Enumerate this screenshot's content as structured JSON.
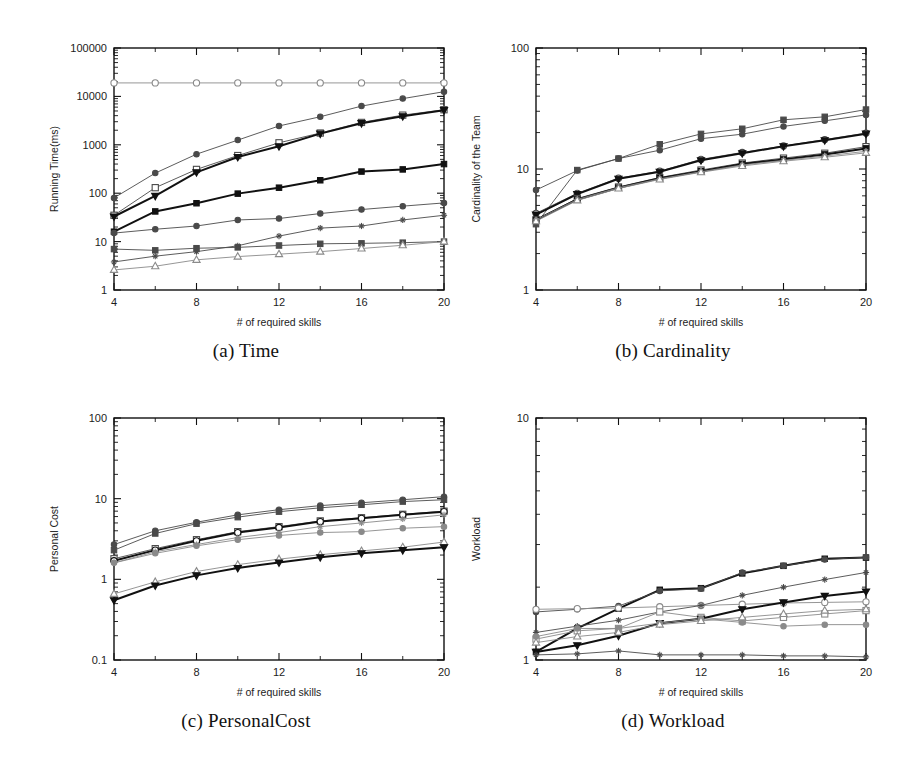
{
  "figure": {
    "panels": [
      {
        "id": "a",
        "caption": "(a) Time",
        "xlabel": "# of required skills",
        "ylabel": "Running Time(ms)"
      },
      {
        "id": "b",
        "caption": "(b) Cardinality",
        "xlabel": "# of required skills",
        "ylabel": "Cardinality of the Team"
      },
      {
        "id": "c",
        "caption": "(c) PersonalCost",
        "xlabel": "# of required skills",
        "ylabel": "Personal Cost"
      },
      {
        "id": "d",
        "caption": "(d) Workload",
        "xlabel": "# of required skills",
        "ylabel": "Workload"
      }
    ]
  },
  "style": {
    "colors": {
      "ink": "#111111",
      "dark": "#1c1c1c",
      "mid": "#4a4a4a",
      "light": "#8a8a8a",
      "paper": "#ffffff"
    },
    "markers": [
      "circle-open",
      "square-open",
      "circle-filled",
      "square-filled",
      "triangle-down-filled",
      "triangle-up-open",
      "cross",
      "diamond-open"
    ]
  },
  "chart_data": [
    {
      "type": "line",
      "panel": "a",
      "title": "(a) Time",
      "xlabel": "# of required skills",
      "ylabel": "Running Time(ms)",
      "xticks": [
        4,
        8,
        12,
        16,
        20
      ],
      "x": [
        4,
        6,
        8,
        10,
        12,
        14,
        16,
        18,
        20
      ],
      "xlim": [
        4,
        20
      ],
      "ylim": [
        1,
        100000
      ],
      "yscale": "log",
      "yticks": [
        1,
        10,
        100,
        1000,
        10000,
        100000
      ],
      "ytick_labels": [
        "1",
        "10",
        "100",
        "1000",
        "10000",
        "100000"
      ],
      "grid": false,
      "legend": "none",
      "series": [
        {
          "name": "S1",
          "marker": "circle-open",
          "weight": "thin",
          "shade": "light",
          "values": [
            19000,
            19000,
            19000,
            19000,
            19000,
            19000,
            19000,
            19000,
            19000
          ]
        },
        {
          "name": "S2",
          "marker": "circle-filled",
          "weight": "thin",
          "shade": "mid",
          "values": [
            80,
            260,
            640,
            1250,
            2450,
            3800,
            6300,
            9000,
            12500
          ]
        },
        {
          "name": "S3",
          "marker": "square-open",
          "weight": "thin",
          "shade": "mid",
          "values": [
            35,
            130,
            310,
            600,
            1100,
            1750,
            2900,
            4100,
            5300
          ]
        },
        {
          "name": "S4",
          "marker": "triangle-down-filled",
          "weight": "thick",
          "shade": "ink",
          "values": [
            33,
            88,
            270,
            560,
            930,
            1700,
            2800,
            3900,
            5200
          ]
        },
        {
          "name": "S5",
          "marker": "square-filled",
          "weight": "thick",
          "shade": "ink",
          "values": [
            16,
            42,
            62,
            98,
            130,
            185,
            280,
            310,
            400
          ]
        },
        {
          "name": "S6",
          "marker": "circle-filled",
          "weight": "thin",
          "shade": "mid",
          "values": [
            15,
            18,
            21,
            28,
            30,
            38,
            46,
            54,
            63
          ]
        },
        {
          "name": "S7",
          "marker": "square-filled",
          "weight": "thin",
          "shade": "mid",
          "values": [
            7.0,
            6.6,
            7.3,
            7.6,
            8.3,
            9.0,
            9.2,
            9.5,
            10.0
          ]
        },
        {
          "name": "S8",
          "marker": "cross",
          "weight": "thin",
          "shade": "mid",
          "values": [
            3.8,
            5.0,
            6.2,
            8.2,
            13.0,
            19.0,
            21.0,
            28.0,
            35.0
          ]
        },
        {
          "name": "S9",
          "marker": "triangle-up-open",
          "weight": "thin",
          "shade": "light",
          "values": [
            2.6,
            3.1,
            4.2,
            4.9,
            5.5,
            6.2,
            7.2,
            8.4,
            10.0
          ]
        }
      ]
    },
    {
      "type": "line",
      "panel": "b",
      "title": "(b) Cardinality",
      "xlabel": "# of required skills",
      "ylabel": "Cardinality of the Team",
      "xticks": [
        4,
        8,
        12,
        16,
        20
      ],
      "x": [
        4,
        6,
        8,
        10,
        12,
        14,
        16,
        18,
        20
      ],
      "xlim": [
        4,
        20
      ],
      "ylim": [
        1,
        100
      ],
      "yscale": "log",
      "yticks": [
        1,
        10,
        100
      ],
      "ytick_labels": [
        "1",
        "10",
        "100"
      ],
      "grid": false,
      "legend": "none",
      "series": [
        {
          "name": "S1",
          "marker": "square-filled",
          "weight": "thin",
          "shade": "mid",
          "values": [
            3.5,
            9.8,
            12.2,
            16.0,
            19.5,
            21.5,
            25.5,
            27.0,
            31.0
          ]
        },
        {
          "name": "S2",
          "marker": "circle-filled",
          "weight": "thin",
          "shade": "mid",
          "values": [
            6.7,
            9.7,
            12.2,
            14.3,
            17.8,
            19.4,
            22.5,
            25.0,
            28.0
          ]
        },
        {
          "name": "S3",
          "marker": "circle-open",
          "weight": "thin",
          "shade": "mid",
          "values": [
            4.3,
            6.3,
            8.4,
            9.6,
            12.0,
            13.7,
            15.5,
            17.5,
            19.8
          ]
        },
        {
          "name": "S4",
          "marker": "triangle-down-filled",
          "weight": "thick",
          "shade": "ink",
          "values": [
            4.2,
            6.2,
            8.3,
            9.5,
            11.8,
            13.5,
            15.4,
            17.3,
            19.6
          ]
        },
        {
          "name": "S5",
          "marker": "square-open",
          "weight": "thin",
          "shade": "mid",
          "values": [
            3.8,
            5.7,
            7.1,
            8.5,
            9.8,
            11.2,
            12.3,
            13.5,
            15.3
          ]
        },
        {
          "name": "S6",
          "marker": "square-filled",
          "weight": "thick",
          "shade": "ink",
          "values": [
            3.8,
            5.6,
            7.0,
            8.4,
            9.6,
            11.0,
            12.0,
            13.2,
            14.8
          ]
        },
        {
          "name": "S7",
          "marker": "cross",
          "weight": "thin",
          "shade": "light",
          "values": [
            3.8,
            5.6,
            7.0,
            8.3,
            9.5,
            10.8,
            11.8,
            12.8,
            14.0
          ]
        },
        {
          "name": "S8",
          "marker": "triangle-up-open",
          "weight": "thin",
          "shade": "light",
          "values": [
            3.7,
            5.5,
            6.9,
            8.2,
            9.4,
            10.6,
            11.6,
            12.5,
            13.6
          ]
        }
      ]
    },
    {
      "type": "line",
      "panel": "c",
      "title": "(c) PersonalCost",
      "xlabel": "# of required skills",
      "ylabel": "Personal Cost",
      "xticks": [
        4,
        8,
        12,
        16,
        20
      ],
      "x": [
        4,
        6,
        8,
        10,
        12,
        14,
        16,
        18,
        20
      ],
      "xlim": [
        4,
        20
      ],
      "ylim": [
        0.1,
        100
      ],
      "yscale": "log",
      "yticks": [
        0.1,
        1,
        10,
        100
      ],
      "ytick_labels": [
        "0.1",
        "1",
        "10",
        "100"
      ],
      "grid": false,
      "legend": "none",
      "series": [
        {
          "name": "S1",
          "marker": "circle-filled",
          "weight": "thin",
          "shade": "mid",
          "values": [
            2.7,
            4.0,
            5.1,
            6.3,
            7.3,
            8.2,
            8.9,
            9.7,
            10.6
          ]
        },
        {
          "name": "S2",
          "marker": "square-filled",
          "weight": "thin",
          "shade": "mid",
          "values": [
            2.3,
            3.7,
            4.9,
            5.9,
            6.9,
            7.7,
            8.4,
            9.2,
            9.7
          ]
        },
        {
          "name": "S3",
          "marker": "square-open",
          "weight": "thin",
          "shade": "mid",
          "values": [
            1.8,
            2.4,
            3.1,
            3.9,
            4.5,
            5.3,
            5.8,
            6.4,
            7.0
          ]
        },
        {
          "name": "S4",
          "marker": "circle-open",
          "weight": "thick",
          "shade": "ink",
          "values": [
            1.7,
            2.3,
            3.0,
            3.8,
            4.4,
            5.2,
            5.7,
            6.3,
            6.9
          ]
        },
        {
          "name": "S5",
          "marker": "cross",
          "weight": "thin",
          "shade": "light",
          "values": [
            1.6,
            2.2,
            2.7,
            3.3,
            3.8,
            4.5,
            5.0,
            5.6,
            6.3
          ]
        },
        {
          "name": "S6",
          "marker": "circle-filled",
          "weight": "thin",
          "shade": "light",
          "values": [
            1.6,
            2.1,
            2.6,
            3.1,
            3.5,
            3.8,
            3.9,
            4.3,
            4.5
          ]
        },
        {
          "name": "S7",
          "marker": "triangle-up-open",
          "weight": "thin",
          "shade": "light",
          "values": [
            0.66,
            0.93,
            1.25,
            1.52,
            1.78,
            2.02,
            2.25,
            2.5,
            2.9
          ]
        },
        {
          "name": "S8",
          "marker": "triangle-down-filled",
          "weight": "thick",
          "shade": "ink",
          "values": [
            0.55,
            0.84,
            1.12,
            1.38,
            1.62,
            1.88,
            2.1,
            2.3,
            2.5
          ]
        }
      ]
    },
    {
      "type": "line",
      "panel": "d",
      "title": "(d) Workload",
      "xlabel": "# of required skills",
      "ylabel": "Workload",
      "xticks": [
        4,
        8,
        12,
        16,
        20
      ],
      "x": [
        4,
        6,
        8,
        10,
        12,
        14,
        16,
        18,
        20
      ],
      "xlim": [
        4,
        20
      ],
      "ylim": [
        1,
        10
      ],
      "yscale": "log",
      "yticks": [
        1,
        10
      ],
      "ytick_labels": [
        "1",
        "10"
      ],
      "grid": false,
      "legend": "none",
      "series": [
        {
          "name": "S1",
          "marker": "square-filled",
          "weight": "thick",
          "shade": "ink",
          "values": [
            1.08,
            1.35,
            1.63,
            1.95,
            1.98,
            2.28,
            2.45,
            2.62,
            2.65
          ]
        },
        {
          "name": "S2",
          "marker": "circle-filled",
          "weight": "thin",
          "shade": "mid",
          "values": [
            1.58,
            1.62,
            1.67,
            1.93,
            1.97,
            2.3,
            2.45,
            2.6,
            2.66
          ]
        },
        {
          "name": "S3",
          "marker": "circle-open",
          "weight": "thin",
          "shade": "light",
          "values": [
            1.62,
            1.63,
            1.64,
            1.66,
            1.68,
            1.7,
            1.72,
            1.73,
            1.74
          ]
        },
        {
          "name": "S4",
          "marker": "cross",
          "weight": "thin",
          "shade": "mid",
          "values": [
            1.3,
            1.38,
            1.46,
            1.58,
            1.68,
            1.85,
            2.0,
            2.15,
            2.3
          ]
        },
        {
          "name": "S5",
          "marker": "square-open",
          "weight": "thin",
          "shade": "light",
          "values": [
            1.22,
            1.32,
            1.35,
            1.58,
            1.5,
            1.45,
            1.5,
            1.55,
            1.6
          ]
        },
        {
          "name": "S6",
          "marker": "triangle-down-filled",
          "weight": "thick",
          "shade": "ink",
          "values": [
            1.08,
            1.15,
            1.26,
            1.42,
            1.48,
            1.62,
            1.73,
            1.84,
            1.92
          ]
        },
        {
          "name": "S7",
          "marker": "circle-filled",
          "weight": "thin",
          "shade": "light",
          "values": [
            1.25,
            1.35,
            1.35,
            1.42,
            1.48,
            1.43,
            1.38,
            1.4,
            1.4
          ]
        },
        {
          "name": "S8",
          "marker": "triangle-up-open",
          "weight": "thin",
          "shade": "light",
          "values": [
            1.18,
            1.25,
            1.3,
            1.4,
            1.45,
            1.5,
            1.55,
            1.6,
            1.62
          ]
        },
        {
          "name": "S9",
          "marker": "cross",
          "weight": "thin",
          "shade": "mid",
          "values": [
            1.05,
            1.06,
            1.09,
            1.05,
            1.05,
            1.05,
            1.04,
            1.04,
            1.03
          ]
        }
      ]
    }
  ]
}
